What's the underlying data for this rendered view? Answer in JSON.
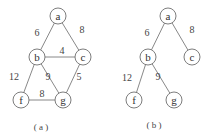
{
  "figures": [
    {
      "caption": "( a )",
      "nodes": [
        {
          "id": "a",
          "label": "a",
          "x": 58,
          "y": 16
        },
        {
          "id": "b",
          "label": "b",
          "x": 37,
          "y": 57
        },
        {
          "id": "c",
          "label": "c",
          "x": 83,
          "y": 57
        },
        {
          "id": "f",
          "label": "f",
          "x": 21,
          "y": 100
        },
        {
          "id": "g",
          "label": "g",
          "x": 63,
          "y": 100
        }
      ],
      "edges": [
        {
          "from": "a",
          "to": "b",
          "weight": "6",
          "lx": 37,
          "ly": 32
        },
        {
          "from": "a",
          "to": "c",
          "weight": "8",
          "lx": 82,
          "ly": 29
        },
        {
          "from": "b",
          "to": "c",
          "weight": "4",
          "lx": 62,
          "ly": 50
        },
        {
          "from": "b",
          "to": "f",
          "weight": "12",
          "lx": 14,
          "ly": 76
        },
        {
          "from": "b",
          "to": "g",
          "weight": "9",
          "lx": 48,
          "ly": 76
        },
        {
          "from": "c",
          "to": "g",
          "weight": "5",
          "lx": 79,
          "ly": 76
        },
        {
          "from": "f",
          "to": "g",
          "weight": "8",
          "lx": 42,
          "ly": 93
        }
      ]
    },
    {
      "caption": "( b )",
      "nodes": [
        {
          "id": "a",
          "label": "a",
          "x": 168,
          "y": 16
        },
        {
          "id": "b",
          "label": "b",
          "x": 148,
          "y": 57
        },
        {
          "id": "c",
          "label": "c",
          "x": 192,
          "y": 57
        },
        {
          "id": "f",
          "label": "f",
          "x": 134,
          "y": 100
        },
        {
          "id": "g",
          "label": "g",
          "x": 174,
          "y": 100
        }
      ],
      "edges": [
        {
          "from": "a",
          "to": "b",
          "weight": "6",
          "lx": 147,
          "ly": 32
        },
        {
          "from": "a",
          "to": "c",
          "weight": "8",
          "lx": 192,
          "ly": 29
        },
        {
          "from": "b",
          "to": "f",
          "weight": "12",
          "lx": 127,
          "ly": 77
        },
        {
          "from": "b",
          "to": "g",
          "weight": "9",
          "lx": 158,
          "ly": 76
        }
      ]
    }
  ]
}
